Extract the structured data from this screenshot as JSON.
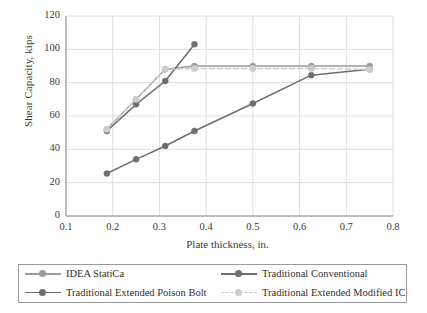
{
  "chart_data": {
    "type": "line",
    "title": "",
    "xlabel": "Plate thickness, in.",
    "ylabel": "Shear Capacity, kips",
    "xlim": [
      0.1,
      0.8
    ],
    "ylim": [
      0,
      120
    ],
    "xticks": [
      "0.1",
      "0.2",
      "0.3",
      "0.4",
      "0.5",
      "0.6",
      "0.7",
      "0.8"
    ],
    "yticks": [
      "0",
      "20",
      "40",
      "60",
      "80",
      "100",
      "120"
    ],
    "grid": true,
    "legend_position": "bottom",
    "series": [
      {
        "name": "IDEA StatiCa",
        "color": "#9a9a9a",
        "style": "solid",
        "marker": "circle",
        "x": [
          0.1875,
          0.25,
          0.3125,
          0.375,
          0.5,
          0.625,
          0.75
        ],
        "y": [
          52,
          70,
          88,
          90,
          90,
          90,
          90
        ]
      },
      {
        "name": "Traditional Conventional",
        "color": "#6e6e6e",
        "style": "solid",
        "marker": "circle",
        "x": [
          0.1875,
          0.25,
          0.3125,
          0.375,
          0.5,
          0.625,
          0.75
        ],
        "y": [
          25.5,
          34,
          42,
          51,
          67.5,
          84.5,
          88
        ]
      },
      {
        "name": "Traditional Extended Poison Bolt",
        "color": "#6e6e6e",
        "style": "solid",
        "marker": "circle",
        "x": [
          0.1875,
          0.25,
          0.3125,
          0.375
        ],
        "y": [
          51,
          67,
          81,
          103
        ]
      },
      {
        "name": "Traditional Extended Modified IC",
        "color": "#c9cdd2",
        "style": "dashed",
        "marker": "circle",
        "x": [
          0.1875,
          0.25,
          0.3125,
          0.375,
          0.5,
          0.625,
          0.75
        ],
        "y": [
          52,
          70,
          88,
          88.5,
          88.5,
          88.5,
          88
        ]
      }
    ]
  },
  "legend": {
    "items": [
      {
        "label": "IDEA StatiCa"
      },
      {
        "label": "Traditional Conventional"
      },
      {
        "label": "Traditional Extended Poison Bolt"
      },
      {
        "label": "Traditional Extended Modified IC"
      }
    ]
  },
  "axes": {
    "x_title": "Plate thickness, in.",
    "y_title": "Shear Capacity, kips"
  }
}
